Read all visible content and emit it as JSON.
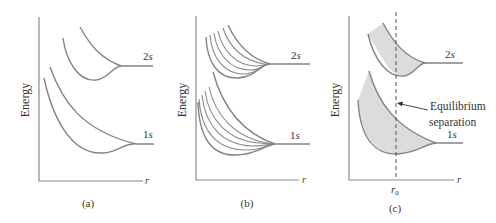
{
  "figure": {
    "panels": [
      {
        "id": "a",
        "caption": "(a)",
        "y_label": "Energy",
        "x_label": "r",
        "levels": [
          {
            "label": "2s",
            "num": "2",
            "sym": "s"
          },
          {
            "label": "1s",
            "num": "1",
            "sym": "s"
          }
        ]
      },
      {
        "id": "b",
        "caption": "(b)",
        "y_label": "Energy",
        "x_label": "r",
        "levels": [
          {
            "label": "2s",
            "num": "2",
            "sym": "s"
          },
          {
            "label": "1s",
            "num": "1",
            "sym": "s"
          }
        ]
      },
      {
        "id": "c",
        "caption": "(c)",
        "y_label": "Energy",
        "x_label": "r",
        "marker_label": "r",
        "marker_sub": "0",
        "annotation_line1": "Equilibrium",
        "annotation_line2": "separation",
        "levels": [
          {
            "label": "2s",
            "num": "2",
            "sym": "s"
          },
          {
            "label": "1s",
            "num": "1",
            "sym": "s"
          }
        ]
      }
    ],
    "colors": {
      "curve": "#8a7f86",
      "axis": "#8a8a8a",
      "fill": "#dcdcdc",
      "text": "#333333"
    }
  }
}
